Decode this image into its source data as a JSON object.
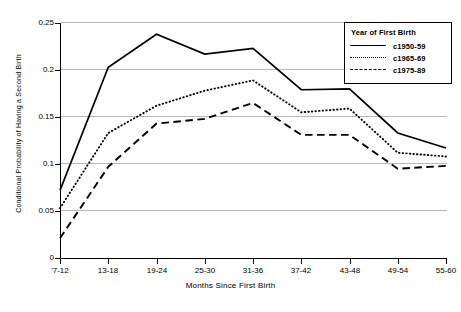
{
  "chart_data": {
    "type": "line",
    "title": "",
    "xlabel": "Months Since First Birth",
    "ylabel": "Conditional Probability of Having a Second Birth",
    "categories": [
      "'7-12",
      "13-18",
      "19-24",
      "25-30",
      "31-36",
      "37-42",
      "43-48",
      "49-54",
      "55-60"
    ],
    "xtick_labels": [
      "'7-12",
      "13-18",
      "19-24",
      "25-30",
      "31-36",
      "37-42",
      "43-48",
      "49-54",
      "55-60"
    ],
    "ytick_labels": [
      "0",
      "0.05",
      "0.1",
      "0.15",
      "0.2",
      "0.25"
    ],
    "ytick_values": [
      0,
      0.05,
      0.1,
      0.15,
      0.2,
      0.25
    ],
    "ylim": [
      0,
      0.25
    ],
    "grid": "horizontal",
    "legend_position": "top-right",
    "legend_title": "Year of First Birth",
    "series": [
      {
        "name": "c1950-59",
        "style": "solid",
        "color": "#000000",
        "values": [
          0.072,
          0.203,
          0.238,
          0.217,
          0.223,
          0.179,
          0.18,
          0.133,
          0.117
        ]
      },
      {
        "name": "c1965-69",
        "style": "dotted",
        "color": "#000000",
        "values": [
          0.053,
          0.133,
          0.162,
          0.178,
          0.189,
          0.155,
          0.159,
          0.112,
          0.108
        ]
      },
      {
        "name": "c1975-89",
        "style": "dashed",
        "color": "#000000",
        "values": [
          0.021,
          0.097,
          0.143,
          0.148,
          0.165,
          0.131,
          0.131,
          0.095,
          0.098
        ]
      }
    ]
  },
  "legend": {
    "title": "Year of First Birth",
    "entries": [
      {
        "label": "c1950-59",
        "style": "solid"
      },
      {
        "label": "c1965-69",
        "style": "dotted"
      },
      {
        "label": "c1975-89",
        "style": "dashed"
      }
    ]
  },
  "axes": {
    "x_title": "Months Since First Birth",
    "y_title": "Conditional Probability of Having a Second Birth"
  },
  "colors": {
    "background": "#ffffff",
    "axis": "#000000",
    "gridline": "#b8b8b8",
    "series": "#000000"
  }
}
